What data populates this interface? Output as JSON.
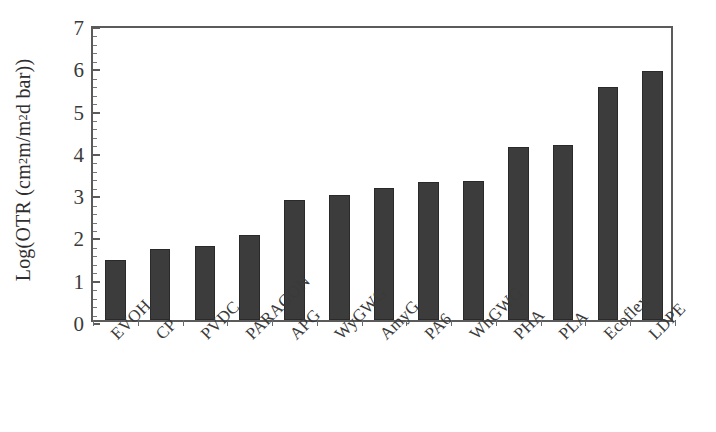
{
  "chart_data": {
    "type": "bar",
    "title": "",
    "subtitle": "",
    "xlabel": "",
    "ylabel": "Log(OTR (cm² m/m² d bar))",
    "ylabel_parts": {
      "prefix": "Log(OTR (cm",
      "sup1": "2",
      "mid": " m/m",
      "sup2": "2",
      "suffix": " d bar))"
    },
    "categories": [
      "EVOH",
      "CP",
      "PVDC",
      "PARAGON",
      "APG",
      "WyGWG",
      "AmyG",
      "PA6",
      "WhGWG",
      "PHA",
      "PLA",
      "Ecoflex",
      "LDPE"
    ],
    "values": [
      1.42,
      1.67,
      1.74,
      2.02,
      2.83,
      2.95,
      3.12,
      3.27,
      3.28,
      4.1,
      4.13,
      5.5,
      5.9
    ],
    "ylim": [
      0,
      7
    ],
    "ytick_labels": [
      "0",
      "1",
      "2",
      "3",
      "4",
      "5",
      "6",
      "7"
    ],
    "ytick_values": [
      0,
      1,
      2,
      3,
      4,
      5,
      6,
      7
    ],
    "grid": false,
    "legend": "none",
    "bar_color": "#3c3c3c",
    "axis_color": "#5b5b5b",
    "background_color": "#ffffff"
  }
}
